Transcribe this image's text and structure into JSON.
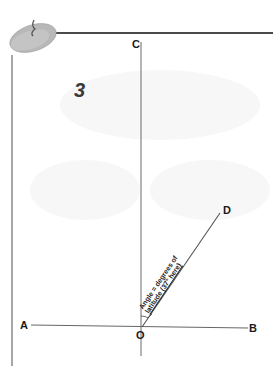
{
  "step_number": "3",
  "points": {
    "A": "A",
    "B": "B",
    "C": "C",
    "D": "D",
    "O": "O"
  },
  "annotation": {
    "line1": "Angle = degrees of",
    "line2": "latitude (37° here)"
  },
  "angle_degrees": 37,
  "colors": {
    "line": "#555555",
    "border": "#4a4a4a",
    "pin": "#b5b5b5",
    "text": "#1a1a1a"
  }
}
